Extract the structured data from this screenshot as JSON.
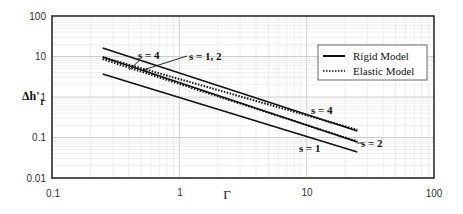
{
  "chart_data": {
    "type": "line",
    "title": "",
    "xlabel": "Γ",
    "ylabel": "Δh'1",
    "xscale": "log",
    "yscale": "log",
    "xlim": [
      0.1,
      100
    ],
    "ylim": [
      0.01,
      100
    ],
    "x_ticks": [
      "0.1",
      "1",
      "10",
      "100"
    ],
    "y_ticks": [
      "0.01",
      "0.1",
      "1",
      "10",
      "100"
    ],
    "grid": true,
    "legend": {
      "position": "upper right",
      "entries": [
        {
          "label": "Rigid Model",
          "style": "solid"
        },
        {
          "label": "Elastic Model",
          "style": "dotted"
        }
      ]
    },
    "series": [
      {
        "name": "Rigid Model s = 4",
        "model": "rigid",
        "s": 4,
        "x": [
          0.25,
          25
        ],
        "values": [
          16.3,
          0.145
        ]
      },
      {
        "name": "Elastic Model s = 4",
        "model": "elastic",
        "s": 4,
        "x": [
          0.25,
          25
        ],
        "values": [
          9.6,
          0.155
        ]
      },
      {
        "name": "Rigid Model s = 2",
        "model": "rigid",
        "s": 2,
        "x": [
          0.25,
          25
        ],
        "values": [
          9.7,
          0.077
        ]
      },
      {
        "name": "Elastic Model s = 2",
        "model": "elastic",
        "s": 2,
        "x": [
          0.25,
          25
        ],
        "values": [
          8.6,
          0.08
        ]
      },
      {
        "name": "Rigid Model s = 1",
        "model": "rigid",
        "s": 1,
        "x": [
          0.25,
          25
        ],
        "values": [
          3.7,
          0.044
        ]
      }
    ],
    "annotations": [
      {
        "text": "s = 4",
        "x": 0.45,
        "y": 6.5,
        "note": "points to upper lines near left"
      },
      {
        "text": "s =  1, 2",
        "x": 1.2,
        "y": 5.5,
        "note": "leader points to middle lines near left"
      },
      {
        "text": "s = 4",
        "x": 14,
        "y": 0.2
      },
      {
        "text": "s = 2",
        "x": 30,
        "y": 0.075
      },
      {
        "text": "s = 1",
        "x": 10,
        "y": 0.042
      }
    ]
  },
  "labels": {
    "xlabel": "Γ",
    "ylabel_main": "Δh'",
    "ylabel_sub": "1",
    "legend_rigid": "Rigid Model",
    "legend_elastic": "Elastic Model",
    "ann_s4_left": "s = 4",
    "ann_s12_left": "s =  1, 2",
    "ann_s4_right": "s = 4",
    "ann_s2_right": "s = 2",
    "ann_s1_right": "s = 1",
    "xtick_0": "0.1",
    "xtick_1": "1",
    "xtick_2": "10",
    "xtick_3": "100",
    "ytick_0": "0.01",
    "ytick_1": "0.1",
    "ytick_2": "1",
    "ytick_3": "10",
    "ytick_4": "100"
  }
}
